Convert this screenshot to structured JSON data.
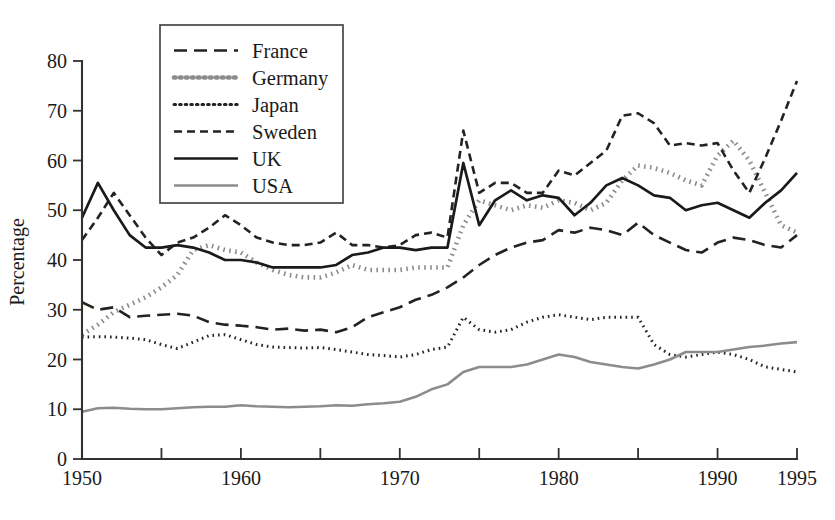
{
  "chart_data": {
    "type": "line",
    "title": "",
    "xlabel": "",
    "ylabel": "Percentage",
    "xlim": [
      1950,
      1995
    ],
    "ylim": [
      0,
      80
    ],
    "grid": false,
    "legend_position": "top-center",
    "x_ticks_labeled": [
      "1950",
      "1960",
      "1970",
      "1980",
      "1990",
      "1995"
    ],
    "x_ticks_labeled_values": [
      1950,
      1960,
      1970,
      1980,
      1990,
      1995
    ],
    "x_ticks_minor_values": [
      1955,
      1965,
      1975,
      1985
    ],
    "y_ticks": [
      "0",
      "10",
      "20",
      "30",
      "40",
      "50",
      "60",
      "70",
      "80"
    ],
    "y_tick_values": [
      0,
      10,
      20,
      30,
      40,
      50,
      60,
      70,
      80
    ],
    "x": [
      1950,
      1951,
      1952,
      1953,
      1954,
      1955,
      1956,
      1957,
      1958,
      1959,
      1960,
      1961,
      1962,
      1963,
      1964,
      1965,
      1966,
      1967,
      1968,
      1969,
      1970,
      1971,
      1972,
      1973,
      1974,
      1975,
      1976,
      1977,
      1978,
      1979,
      1980,
      1981,
      1982,
      1983,
      1984,
      1985,
      1986,
      1987,
      1988,
      1989,
      1990,
      1991,
      1992,
      1993,
      1994,
      1995
    ],
    "series": [
      {
        "name": "France",
        "style": "long-dash",
        "color": "#26231f",
        "width": 2.6,
        "dash": "13,7",
        "values": [
          31.5,
          30.0,
          30.5,
          28.5,
          28.8,
          29.0,
          29.2,
          28.8,
          27.5,
          27.0,
          26.8,
          26.5,
          26.0,
          26.2,
          25.8,
          26.0,
          25.5,
          26.5,
          28.5,
          29.5,
          30.5,
          32.0,
          33.0,
          34.5,
          36.5,
          39.0,
          41.0,
          42.5,
          43.5,
          44.0,
          46.0,
          45.5,
          46.5,
          46.0,
          45.0,
          47.5,
          45.0,
          43.5,
          42.0,
          41.5,
          43.5,
          44.5,
          44.0,
          43.0,
          42.5,
          45.0
        ]
      },
      {
        "name": "Germany",
        "style": "thick-dotted",
        "color": "#8c8c8c",
        "width": 4.6,
        "dash": "1.6,4.4",
        "values": [
          25.0,
          27.0,
          29.5,
          31.0,
          32.5,
          34.5,
          37.0,
          42.0,
          43.0,
          42.0,
          41.5,
          39.5,
          38.0,
          37.0,
          36.5,
          36.5,
          37.5,
          39.0,
          38.0,
          38.0,
          38.0,
          38.5,
          38.5,
          38.5,
          47.0,
          52.0,
          51.0,
          50.0,
          51.0,
          50.5,
          52.0,
          51.5,
          50.0,
          51.5,
          56.0,
          59.0,
          58.5,
          57.5,
          56.0,
          55.0,
          61.0,
          64.0,
          60.0,
          53.5,
          47.0,
          45.5
        ]
      },
      {
        "name": "Japan",
        "style": "dotted",
        "color": "#26231f",
        "width": 3.0,
        "dash": "1.6,4.0",
        "values": [
          24.5,
          24.6,
          24.5,
          24.3,
          24.0,
          23.0,
          22.2,
          23.5,
          24.8,
          25.0,
          24.0,
          23.0,
          22.5,
          22.4,
          22.3,
          22.4,
          22.0,
          21.5,
          21.0,
          20.8,
          20.5,
          21.0,
          22.0,
          22.5,
          28.5,
          26.0,
          25.5,
          26.0,
          27.5,
          28.5,
          29.0,
          28.5,
          28.0,
          28.5,
          28.5,
          28.5,
          23.0,
          21.0,
          20.5,
          21.0,
          21.5,
          21.0,
          20.0,
          18.5,
          18.0,
          17.5
        ]
      },
      {
        "name": "Sweden",
        "style": "short-dash",
        "color": "#26231f",
        "width": 2.6,
        "dash": "8,5",
        "values": [
          44.0,
          48.5,
          53.5,
          49.0,
          44.5,
          41.0,
          43.5,
          44.5,
          46.5,
          49.0,
          47.0,
          44.5,
          43.5,
          43.0,
          43.0,
          43.5,
          45.5,
          43.0,
          43.0,
          42.5,
          43.0,
          45.0,
          45.5,
          44.5,
          66.0,
          53.5,
          55.5,
          55.5,
          53.5,
          53.5,
          58.0,
          57.0,
          59.5,
          62.0,
          69.0,
          69.5,
          67.5,
          63.0,
          63.5,
          63.0,
          63.5,
          58.0,
          53.5,
          60.5,
          68.0,
          76.0
        ]
      },
      {
        "name": "UK",
        "style": "solid",
        "color": "#1a1a1a",
        "width": 2.7,
        "dash": "none",
        "values": [
          48.5,
          55.5,
          50.0,
          45.0,
          42.5,
          42.5,
          43.0,
          42.5,
          41.5,
          40.0,
          40.0,
          39.5,
          38.5,
          38.5,
          38.5,
          38.5,
          39.0,
          41.0,
          41.5,
          42.5,
          42.5,
          42.0,
          42.5,
          42.5,
          59.5,
          47.0,
          52.0,
          54.0,
          52.0,
          53.0,
          52.5,
          49.0,
          51.5,
          55.0,
          56.5,
          55.0,
          53.0,
          52.5,
          50.0,
          51.0,
          51.5,
          50.0,
          48.5,
          51.5,
          54.0,
          57.5
        ]
      },
      {
        "name": "USA",
        "style": "solid",
        "color": "#8c8c8c",
        "width": 2.6,
        "dash": "none",
        "values": [
          9.5,
          10.2,
          10.3,
          10.1,
          10.0,
          10.0,
          10.2,
          10.4,
          10.5,
          10.5,
          10.8,
          10.6,
          10.5,
          10.4,
          10.5,
          10.6,
          10.8,
          10.7,
          11.0,
          11.2,
          11.5,
          12.5,
          14.0,
          15.0,
          17.5,
          18.5,
          18.5,
          18.5,
          19.0,
          20.0,
          21.0,
          20.5,
          19.5,
          19.0,
          18.5,
          18.2,
          19.0,
          20.0,
          21.5,
          21.5,
          21.5,
          22.0,
          22.5,
          22.8,
          23.2,
          23.5
        ]
      }
    ]
  },
  "legend": {
    "entries": [
      {
        "label": "France"
      },
      {
        "label": "Germany"
      },
      {
        "label": "Japan"
      },
      {
        "label": "Sweden"
      },
      {
        "label": "UK"
      },
      {
        "label": "USA"
      }
    ]
  },
  "axes": {
    "y_axis_title": "Percentage"
  }
}
